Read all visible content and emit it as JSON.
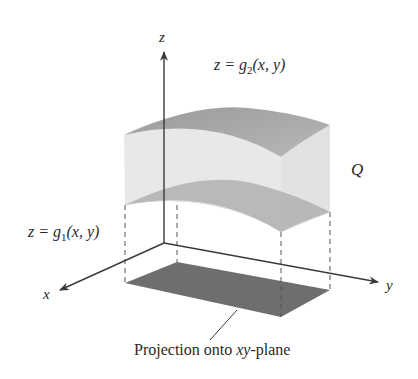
{
  "figure": {
    "colors": {
      "background": "#ffffff",
      "axis": "#3a3a3a",
      "top_surface": "#a9a9a9",
      "side_surface": "#e6e6e6",
      "bottom_surface": "#b4b4b4",
      "projection": "#6e6e6e",
      "dashed": "#555555",
      "text": "#2a2a2a"
    },
    "axes": {
      "z_label": "z",
      "x_label": "x",
      "y_label": "y"
    },
    "labels": {
      "upper_surface": {
        "prefix": "z = g",
        "subscript": "2",
        "suffix": "(x, y)"
      },
      "lower_surface": {
        "prefix": "z = g",
        "subscript": "1",
        "suffix": "(x, y)"
      },
      "region": "Q",
      "projection_caption_pre": "Projection onto ",
      "projection_caption_var": "xy",
      "projection_caption_post": "-plane"
    }
  }
}
